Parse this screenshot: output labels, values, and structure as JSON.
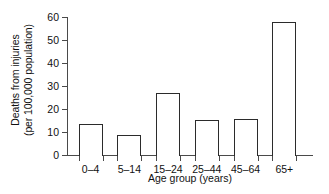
{
  "chart_data": {
    "type": "bar",
    "title": "",
    "subtitle": "",
    "categories": [
      "0–4",
      "5–14",
      "15–24",
      "25–44",
      "45–64",
      "65+"
    ],
    "values": [
      13.5,
      8.5,
      27,
      15.3,
      15.6,
      58
    ],
    "xlabel": "Age group (years)",
    "ylabel_line1": "Deaths from injuries",
    "ylabel_line2": "(per 100,000 population)",
    "ylim": [
      0,
      60
    ],
    "yticks": [
      0,
      10,
      20,
      30,
      40,
      50,
      60
    ],
    "ytick_labels": [
      "0",
      "10",
      "20",
      "30",
      "40",
      "50",
      "60"
    ],
    "grid": false,
    "legend": "none",
    "bar_facecolor": "#ffffff",
    "bar_edgecolor": "#2b2b2b",
    "axis_color": "#4a4a4a",
    "background": "#ffffff"
  }
}
